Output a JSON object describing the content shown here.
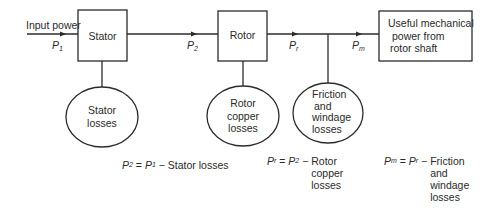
{
  "diagram": {
    "input": {
      "label": "Input power",
      "symbol": "P",
      "sub": "1"
    },
    "blocks": [
      {
        "id": "stator",
        "label": "Stator"
      },
      {
        "id": "rotor",
        "label": "Rotor"
      },
      {
        "id": "output",
        "lines": [
          "Useful mechanical",
          "power from",
          "rotor shaft"
        ]
      }
    ],
    "flows": [
      {
        "symbol": "P",
        "sub": "1"
      },
      {
        "symbol": "P",
        "sub": "2"
      },
      {
        "symbol": "P",
        "sub": "r"
      },
      {
        "symbol": "P",
        "sub": "m"
      }
    ],
    "losses": [
      {
        "id": "stator-losses",
        "lines": [
          "Stator",
          "losses"
        ]
      },
      {
        "id": "rotor-copper-losses",
        "lines": [
          "Rotor",
          "copper",
          "losses"
        ]
      },
      {
        "id": "friction-windage-losses",
        "lines": [
          "Friction",
          "and",
          "windage",
          "losses"
        ]
      }
    ],
    "equations": [
      {
        "lhs_sym": "P",
        "lhs_sub": "2",
        "eq": " = ",
        "rhs_sym": "P",
        "rhs_sub": "1",
        "minus": " − ",
        "terms": [
          "Stator losses"
        ]
      },
      {
        "lhs_sym": "P",
        "lhs_sub": "r",
        "eq": " = ",
        "rhs_sym": "P",
        "rhs_sub": "2",
        "minus": " − ",
        "terms": [
          "Rotor",
          "copper",
          "losses"
        ]
      },
      {
        "lhs_sym": "P",
        "lhs_sub": "m",
        "eq": " = ",
        "rhs_sym": "P",
        "rhs_sub": "r",
        "minus": " − ",
        "terms": [
          "Friction",
          "and",
          "windage",
          "losses"
        ]
      }
    ]
  }
}
